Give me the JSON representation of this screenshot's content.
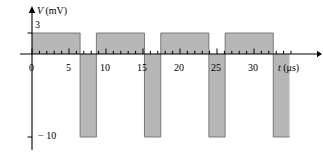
{
  "figure": {
    "title": "",
    "yaxis_label_var": "V",
    "yaxis_label_unit": "(mV)",
    "xaxis_label_var": "t",
    "xaxis_label_unit": "(μs)",
    "y_tick_high": "3",
    "y_tick_low": "− 10",
    "x_tick_labels": [
      "0",
      "5",
      "10",
      "15",
      "20",
      "25",
      "30"
    ],
    "colors": {
      "fill": "#b7b7b7",
      "stroke": "#6f6f6f",
      "axis": "#000000",
      "background": "#ffffff"
    }
  },
  "chart_data": {
    "type": "line",
    "title": "",
    "xlabel": "t (μs)",
    "ylabel": "V (mV)",
    "xlim": [
      -1,
      39
    ],
    "ylim": [
      -10,
      3
    ],
    "grid": false,
    "legend": null,
    "x_ticks": [
      0,
      5,
      10,
      15,
      20,
      25,
      30
    ],
    "x_minor_tick_step": 1,
    "y_ticks": [
      3,
      -10
    ],
    "waveform": {
      "description": "periodic rectangular pulse train",
      "high_value": 3,
      "low_value": -10,
      "period": 8.7,
      "high_duration": 6.5,
      "low_duration": 2.2,
      "start": 0
    },
    "segments": [
      {
        "t_start": 0.0,
        "t_end": 6.5,
        "v": 3
      },
      {
        "t_start": 6.5,
        "t_end": 8.7,
        "v": -10
      },
      {
        "t_start": 8.7,
        "t_end": 15.2,
        "v": 3
      },
      {
        "t_start": 15.2,
        "t_end": 17.4,
        "v": -10
      },
      {
        "t_start": 17.4,
        "t_end": 23.9,
        "v": 3
      },
      {
        "t_start": 23.9,
        "t_end": 26.1,
        "v": -10
      },
      {
        "t_start": 26.1,
        "t_end": 32.6,
        "v": 3
      },
      {
        "t_start": 32.6,
        "t_end": 34.8,
        "v": -10
      }
    ]
  }
}
